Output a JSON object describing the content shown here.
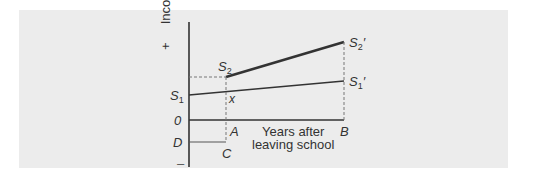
{
  "diagram": {
    "y_axis_label": "Income",
    "plus_sign": "+",
    "minus_sign": "–",
    "x_axis_label_line1": "Years after",
    "x_axis_label_line2": "leaving school",
    "points": {
      "S1": "S",
      "S1_sub": "1",
      "S2": "S",
      "S2_sub": "2",
      "S2p": "S",
      "S2p_sub": "2",
      "S2p_prime": "′",
      "S1p": "S",
      "S1p_sub": "1",
      "S1p_prime": "′",
      "x": "x",
      "O": "0",
      "A": "A",
      "B": "B",
      "C": "C",
      "D": "D"
    },
    "colors": {
      "panel": "#ececec",
      "line": "#333333",
      "dashed": "#777777"
    }
  }
}
